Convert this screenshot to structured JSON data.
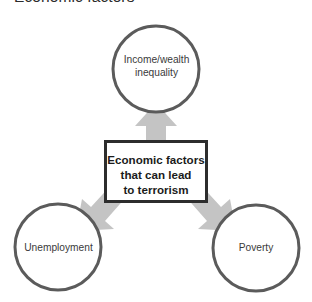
{
  "title": "Economic factors",
  "diagram": {
    "type": "radial-block-arrow-diagram",
    "center": {
      "name": "center-box",
      "text": "Economic factors\nthat can lead\nto terrorism",
      "shape": "rectangle",
      "border_color": "#2d2d2d",
      "fill_color": "#ffffff"
    },
    "nodes": [
      {
        "name": "node-income-wealth-inequality",
        "text": "Income/wealth\ninequality",
        "position": "top",
        "shape": "circle",
        "stroke_color": "#5b5b5b",
        "fill_color": "#ffffff"
      },
      {
        "name": "node-unemployment",
        "text": "Unemployment",
        "position": "bottom-left",
        "shape": "circle",
        "stroke_color": "#5b5b5b",
        "fill_color": "#ffffff"
      },
      {
        "name": "node-poverty",
        "text": "Poverty",
        "position": "bottom-right",
        "shape": "circle",
        "stroke_color": "#5b5b5b",
        "fill_color": "#ffffff"
      }
    ],
    "arrows": [
      {
        "name": "arrow-up",
        "from": "center-box",
        "to": "node-income-wealth-inequality",
        "direction": "up",
        "fill_color": "#c4c4c4"
      },
      {
        "name": "arrow-down-left",
        "from": "center-box",
        "to": "node-unemployment",
        "direction": "down-left",
        "fill_color": "#c4c4c4"
      },
      {
        "name": "arrow-down-right",
        "from": "center-box",
        "to": "node-poverty",
        "direction": "down-right",
        "fill_color": "#c4c4c4"
      }
    ]
  }
}
